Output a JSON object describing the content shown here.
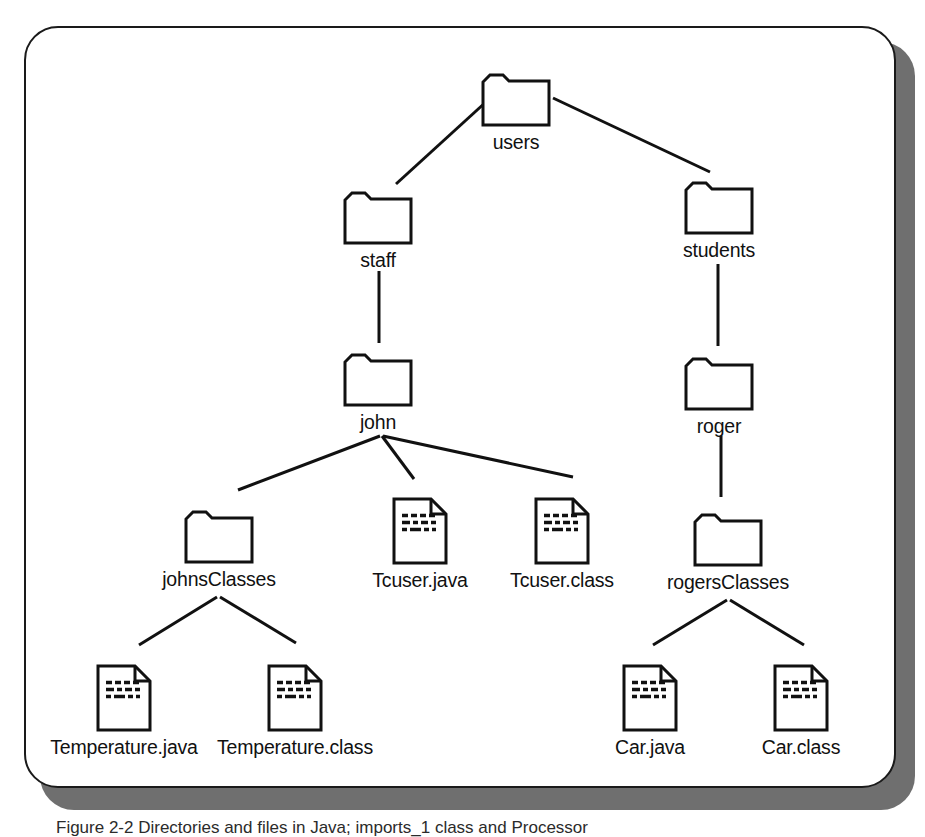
{
  "figure": {
    "caption": "Figure 2-2  Directories and files in Java; imports_1 class and Processor",
    "panel_border_color": "#1a1a1a",
    "panel_shadow_color": "#6f6f6f",
    "background_color": "#ffffff",
    "ink_color": "#111111"
  },
  "diagram": {
    "type": "directory-tree",
    "nodes": [
      {
        "id": "users",
        "label": "users",
        "icon": "folder-icon",
        "x": 516,
        "y": 68,
        "level": 0
      },
      {
        "id": "staff",
        "label": "staff",
        "icon": "folder-icon",
        "x": 378,
        "y": 186,
        "level": 1
      },
      {
        "id": "students",
        "label": "students",
        "icon": "folder-icon",
        "x": 719,
        "y": 176,
        "level": 1
      },
      {
        "id": "john",
        "label": "john",
        "icon": "folder-icon",
        "x": 378,
        "y": 348,
        "level": 2
      },
      {
        "id": "roger",
        "label": "roger",
        "icon": "folder-icon",
        "x": 719,
        "y": 352,
        "level": 2
      },
      {
        "id": "johnsClasses",
        "label": "johnsClasses",
        "icon": "folder-icon",
        "x": 219,
        "y": 505,
        "level": 3
      },
      {
        "id": "Tcuser.java",
        "label": "Tcuser.java",
        "icon": "file-icon",
        "x": 420,
        "y": 496,
        "level": 3
      },
      {
        "id": "Tcuser.class",
        "label": "Tcuser.class",
        "icon": "file-icon",
        "x": 562,
        "y": 496,
        "level": 3
      },
      {
        "id": "rogersClasses",
        "label": "rogersClasses",
        "icon": "folder-icon",
        "x": 728,
        "y": 508,
        "level": 3
      },
      {
        "id": "Temperature.java",
        "label": "Temperature.java",
        "icon": "file-icon",
        "x": 124,
        "y": 663,
        "level": 4
      },
      {
        "id": "Temperature.class",
        "label": "Temperature.class",
        "icon": "file-icon",
        "x": 295,
        "y": 663,
        "level": 4
      },
      {
        "id": "Car.java",
        "label": "Car.java",
        "icon": "file-icon",
        "x": 650,
        "y": 663,
        "level": 4
      },
      {
        "id": "Car.class",
        "label": "Car.class",
        "icon": "file-icon",
        "x": 801,
        "y": 663,
        "level": 4
      }
    ],
    "edges": [
      {
        "from": "users",
        "to": "staff",
        "x1": 487,
        "y1": 101,
        "x2": 396,
        "y2": 184
      },
      {
        "from": "users",
        "to": "students",
        "x1": 553,
        "y1": 98,
        "x2": 710,
        "y2": 172
      },
      {
        "from": "staff",
        "to": "john",
        "x1": 379,
        "y1": 271,
        "x2": 379,
        "y2": 343
      },
      {
        "from": "students",
        "to": "roger",
        "x1": 718,
        "y1": 264,
        "x2": 718,
        "y2": 346
      },
      {
        "from": "john",
        "to": "johnsClasses",
        "x1": 380,
        "y1": 436,
        "x2": 238,
        "y2": 490
      },
      {
        "from": "john",
        "to": "Tcuser.java",
        "x1": 382,
        "y1": 436,
        "x2": 414,
        "y2": 479
      },
      {
        "from": "john",
        "to": "Tcuser.class",
        "x1": 383,
        "y1": 436,
        "x2": 573,
        "y2": 477
      },
      {
        "from": "roger",
        "to": "rogersClasses",
        "x1": 721,
        "y1": 436,
        "x2": 721,
        "y2": 497
      },
      {
        "from": "johnsClasses",
        "to": "Temperature.java",
        "x1": 217,
        "y1": 597,
        "x2": 139,
        "y2": 645
      },
      {
        "from": "johnsClasses",
        "to": "Temperature.class",
        "x1": 220,
        "y1": 597,
        "x2": 296,
        "y2": 643
      },
      {
        "from": "rogersClasses",
        "to": "Car.java",
        "x1": 727,
        "y1": 600,
        "x2": 653,
        "y2": 645
      },
      {
        "from": "rogersClasses",
        "to": "Car.class",
        "x1": 730,
        "y1": 600,
        "x2": 804,
        "y2": 645
      }
    ]
  }
}
